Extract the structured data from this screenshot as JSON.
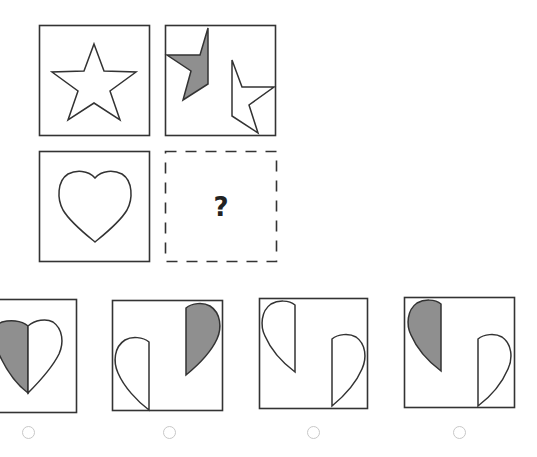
{
  "puzzle": {
    "question_mark": "?",
    "grid": [
      {
        "position": "top-left",
        "shape": "star",
        "state": "whole outline"
      },
      {
        "position": "top-right",
        "shape": "star",
        "state": "split into two halves: left half shaded gray (top-left), right half white (bottom-right)"
      },
      {
        "position": "bottom-left",
        "shape": "heart",
        "state": "whole outline"
      },
      {
        "position": "bottom-right",
        "shape": "unknown",
        "state": "dashed placeholder with question mark"
      }
    ],
    "options": [
      {
        "index": 1,
        "description": "heart whole, left half shaded gray",
        "selected": false
      },
      {
        "index": 2,
        "description": "split heart: left half white at bottom-left, right half shaded at top-right",
        "selected": false
      },
      {
        "index": 3,
        "description": "split heart: left half white at top-left, right half white at bottom-right",
        "selected": false
      },
      {
        "index": 4,
        "description": "split heart: left half shaded at top-left, right half white at bottom-right",
        "selected": false
      }
    ]
  },
  "colors": {
    "stroke": "#333333",
    "shade": "#8f8f8f",
    "radio_border": "#c8c8c8"
  }
}
